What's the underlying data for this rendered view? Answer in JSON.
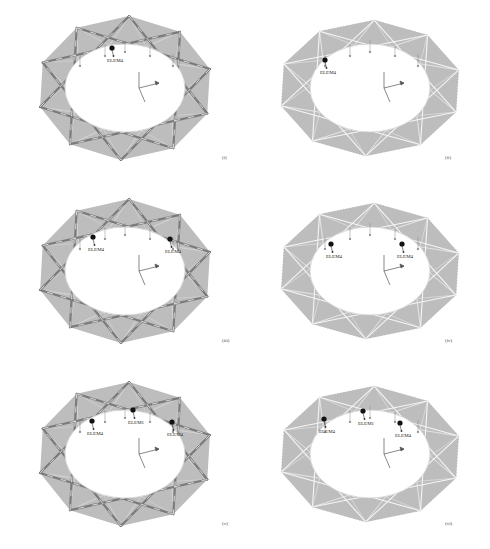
{
  "figure": {
    "panels": [
      {
        "id": "i",
        "label": "(i)",
        "style": "star-bars",
        "elements": [
          {
            "name": "ELEM4",
            "x": 112,
            "y": 56
          }
        ]
      },
      {
        "id": "ii",
        "label": "(ii)",
        "style": "dense-mesh",
        "elements": [
          {
            "name": "ELEM4",
            "x": 80,
            "y": 68
          }
        ]
      },
      {
        "id": "iii",
        "label": "(iii)",
        "style": "star-bars",
        "elements": [
          {
            "name": "ELEM4",
            "x": 93,
            "y": 62
          },
          {
            "name": "ELEM4",
            "x": 170,
            "y": 64
          }
        ]
      },
      {
        "id": "iv",
        "label": "(iv)",
        "style": "dense-mesh",
        "elements": [
          {
            "name": "ELEM4",
            "x": 86,
            "y": 69
          },
          {
            "name": "ELEM4",
            "x": 157,
            "y": 69
          }
        ]
      },
      {
        "id": "v",
        "label": "(v)",
        "style": "star-bars",
        "elements": [
          {
            "name": "ELEM4",
            "x": 92,
            "y": 63
          },
          {
            "name": "ELEM1",
            "x": 133,
            "y": 52
          },
          {
            "name": "ELEM4",
            "x": 172,
            "y": 64
          }
        ]
      },
      {
        "id": "vi",
        "label": "(vi)",
        "style": "dense-mesh",
        "elements": [
          {
            "name": "ELEM4",
            "x": 79,
            "y": 61
          },
          {
            "name": "ELEM1",
            "x": 118,
            "y": 53
          },
          {
            "name": "ELEM4",
            "x": 155,
            "y": 65
          }
        ]
      }
    ],
    "colors": {
      "ring_fill": "#bdbdbd",
      "bar_color": "#7a7a7a",
      "mesh_line": "#e8e8e8",
      "marker": "#111111"
    }
  }
}
